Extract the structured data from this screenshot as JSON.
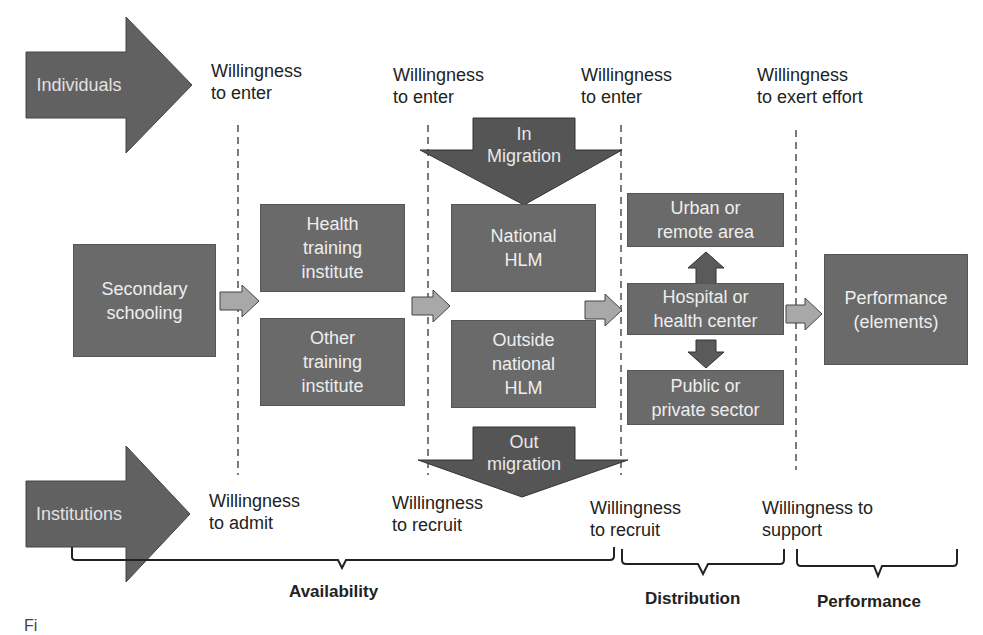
{
  "actors": {
    "individuals": "Individuals",
    "institutions": "Institutions"
  },
  "top_labels": [
    "Willingness\nto enter",
    "Willingness\nto enter",
    "Willingness\nto enter",
    "Willingness\nto exert effort"
  ],
  "bottom_labels": [
    "Willingness\nto admit",
    "Willingness\nto recruit",
    "Willingness\nto recruit",
    "Willingness to\nsupport"
  ],
  "migration": {
    "in": "In\nMigration",
    "out": "Out\nmigration"
  },
  "boxes": {
    "secondary": "Secondary\nschooling",
    "health_training": "Health\ntraining\ninstitute",
    "other_training": "Other\ntraining\ninstitute",
    "national_hlm": "National\nHLM",
    "outside_hlm": "Outside\nnational\nHLM",
    "urban": "Urban or\nremote area",
    "hospital": "Hospital or\nhealth center",
    "sector": "Public or\nprivate sector",
    "performance": "Performance\n(elements)"
  },
  "phases": [
    "Availability",
    "Distribution",
    "Performance"
  ],
  "caption_fragment": "Fi",
  "colors": {
    "box_fill": "#6a6a6a",
    "box_text": "#eeeeee",
    "big_arrow": "#616161",
    "small_arrow": "#a8a8a8",
    "line": "#222222"
  }
}
